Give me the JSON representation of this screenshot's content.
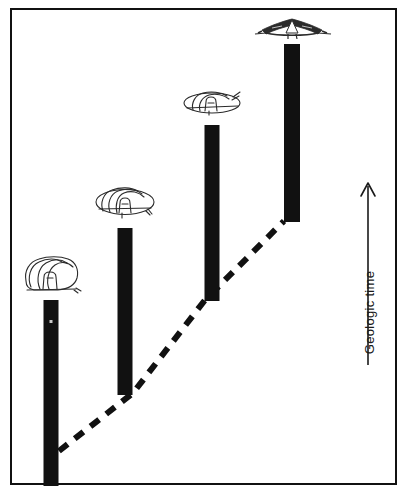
{
  "figure": {
    "title": "",
    "axis": {
      "label": "Geologic time",
      "direction": "up",
      "arrow_name": "up-arrow-icon"
    },
    "frame": {
      "border_color": "#111111",
      "background_color": "#ffffff"
    },
    "colors": {
      "bar": "#111111",
      "trend_line": "#111111",
      "fossil_outline": "#2b2b2b",
      "background": "#ffffff"
    }
  },
  "chart_data": {
    "type": "bar",
    "title": "",
    "xlabel": "",
    "ylabel": "Geologic time",
    "grid": false,
    "legend": false,
    "orientation": "vertical",
    "note": "Four vertical range bars of increasing stratigraphic height, connected at their bases by a dashed trend line; a fossil morphology sketch sits above each bar.",
    "categories": [
      "Stage 1",
      "Stage 2",
      "Stage 3",
      "Stage 4"
    ],
    "bars": [
      {
        "index": 1,
        "x_center": 51,
        "width": 15,
        "top": 300,
        "bottom": 486,
        "height": 186,
        "fossil": "rounded-domed-shell",
        "fossil_name": "fossil-sketch-1"
      },
      {
        "index": 2,
        "x_center": 125,
        "width": 15,
        "top": 228,
        "bottom": 395,
        "height": 167,
        "fossil": "broad-oval-shell",
        "fossil_name": "fossil-sketch-2"
      },
      {
        "index": 3,
        "x_center": 212,
        "width": 15,
        "top": 125,
        "bottom": 301,
        "height": 176,
        "fossil": "flattened-ellipse-shell",
        "fossil_name": "fossil-sketch-3"
      },
      {
        "index": 4,
        "x_center": 292,
        "width": 16,
        "top": 44,
        "bottom": 222,
        "height": 178,
        "fossil": "wide-winged-spinose-shell",
        "fossil_name": "fossil-sketch-4"
      }
    ],
    "trend_line": {
      "style": "dashed",
      "points": [
        {
          "x": 59,
          "y": 451
        },
        {
          "x": 133,
          "y": 393
        },
        {
          "x": 205,
          "y": 300
        },
        {
          "x": 284,
          "y": 221
        }
      ]
    },
    "axis_arrow": {
      "x": 368,
      "y_tail": 365,
      "y_head": 183
    }
  }
}
